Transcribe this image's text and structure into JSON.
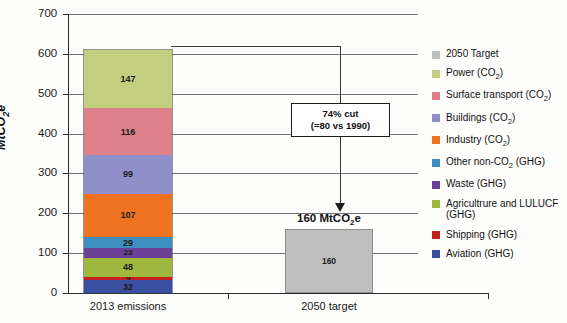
{
  "chart_data": {
    "type": "bar",
    "subtype": "stacked-bar",
    "title": "",
    "xlabel": "",
    "ylabel": "MtCO2e",
    "ylabel_display": "MtCO₂e",
    "ylim": [
      0,
      700
    ],
    "ytick_step": 100,
    "yticks": [
      700,
      600,
      500,
      400,
      300,
      200,
      100,
      0
    ],
    "ytick_labels": [
      "700",
      "600",
      "500",
      "400",
      "300",
      "200",
      "100",
      "0"
    ],
    "grid": true,
    "grid_axis": "y",
    "legend_position": "right",
    "categories": [
      "2013 emissions",
      "2050 target"
    ],
    "series": [
      {
        "name": "Power (CO2)",
        "label": "Power (CO₂)",
        "color": "#c3cf7e",
        "values": [
          147,
          0
        ],
        "stack_order": 9
      },
      {
        "name": "Surface transport (CO2)",
        "label": "Surface transport (CO₂)",
        "color": "#dd8089",
        "values": [
          116,
          0
        ],
        "stack_order": 8
      },
      {
        "name": "Buildings (CO2)",
        "label": "Buildings (CO₂)",
        "color": "#8e8fc8",
        "values": [
          99,
          0
        ],
        "stack_order": 7
      },
      {
        "name": "Industry (CO2)",
        "label": "Industry (CO₂)",
        "color": "#ee7220",
        "values": [
          107,
          0
        ],
        "stack_order": 6
      },
      {
        "name": "Other non-CO2 (GHG)",
        "label": "Other non-CO₂ (GHG)",
        "color": "#3d8fc0",
        "values": [
          29,
          0
        ],
        "stack_order": 5
      },
      {
        "name": "Waste (GHG)",
        "label": "Waste (GHG)",
        "color": "#6b3f96",
        "values": [
          23,
          0
        ],
        "stack_order": 4
      },
      {
        "name": "Agricultrure and LULUCF (GHG)",
        "label": "Agricultrure and LULUCF (GHG)",
        "color": "#9eb83f",
        "values": [
          48,
          0
        ],
        "stack_order": 3
      },
      {
        "name": "Shipping (GHG)",
        "label": "Shipping (GHG)",
        "color": "#c4201f",
        "values": [
          9,
          0
        ],
        "stack_order": 2
      },
      {
        "name": "Aviation (GHG)",
        "label": "Aviation (GHG)",
        "color": "#3b4fa0",
        "values": [
          32,
          0
        ],
        "stack_order": 1
      },
      {
        "name": "2050 Target",
        "label": "2050 Target",
        "color": "#bfbfbf",
        "values": [
          0,
          160
        ],
        "stack_order": 0
      }
    ],
    "totals": [
      610,
      160
    ],
    "annotations": [
      {
        "text_line1": "74% cut",
        "text_line2": "(=80 vs 1990)",
        "type": "callout-box-with-arrow"
      },
      {
        "text": "160 MtCO₂e",
        "type": "bar-value-label",
        "attached_to": "2050 target"
      }
    ]
  },
  "axis": {
    "y_label_main": "MtCO",
    "y_label_sub": "2",
    "y_label_tail": "e",
    "ticks": [
      {
        "value": "700"
      },
      {
        "value": "600"
      },
      {
        "value": "500"
      },
      {
        "value": "400"
      },
      {
        "value": "300"
      },
      {
        "value": "200"
      },
      {
        "value": "100"
      },
      {
        "value": "0"
      }
    ]
  },
  "categories": [
    {
      "label": "2013 emissions"
    },
    {
      "label": "2050 target"
    }
  ],
  "stack_segments": [
    {
      "value": "147",
      "color": "#c3cf7e",
      "name": "power"
    },
    {
      "value": "116",
      "color": "#dd8089",
      "name": "surface-transport"
    },
    {
      "value": "99",
      "color": "#8e8fc8",
      "name": "buildings"
    },
    {
      "value": "107",
      "color": "#ee7220",
      "name": "industry"
    },
    {
      "value": "29",
      "color": "#3d8fc0",
      "name": "other-non-co2"
    },
    {
      "value": "23",
      "color": "#6b3f96",
      "name": "waste"
    },
    {
      "value": "48",
      "color": "#9eb83f",
      "name": "agriculture-lulucf"
    },
    {
      "value": "9",
      "color": "#c4201f",
      "name": "shipping"
    },
    {
      "value": "32",
      "color": "#3b4fa0",
      "name": "aviation"
    }
  ],
  "target_bar": {
    "value": "160",
    "caption_main": "160 MtCO",
    "caption_sub": "2",
    "caption_tail": "e",
    "color": "#bfbfbf"
  },
  "callout": {
    "line1": "74% cut",
    "line2": "(=80 vs 1990)"
  },
  "legend": {
    "items": [
      {
        "label": "2050 Target",
        "color": "#bfbfbf",
        "has_sub": false,
        "name": "2050-target"
      },
      {
        "label": "Power (CO",
        "sub": "2",
        "tail": ")",
        "color": "#c3cf7e",
        "has_sub": true,
        "name": "power"
      },
      {
        "label": "Surface transport (CO",
        "sub": "2",
        "tail": ")",
        "color": "#dd8089",
        "has_sub": true,
        "name": "surface-transport"
      },
      {
        "label": "Buildings (CO",
        "sub": "2",
        "tail": ")",
        "color": "#8e8fc8",
        "has_sub": true,
        "name": "buildings"
      },
      {
        "label": "Industry (CO",
        "sub": "2",
        "tail": ")",
        "color": "#ee7220",
        "has_sub": true,
        "name": "industry"
      },
      {
        "label": "Other non-CO",
        "sub": "2",
        "tail": " (GHG)",
        "color": "#3d8fc0",
        "has_sub": true,
        "name": "other-non-co2"
      },
      {
        "label": "Waste (GHG)",
        "color": "#6b3f96",
        "has_sub": false,
        "name": "waste"
      },
      {
        "label": "Agricultrure and LULUCF (GHG)",
        "color": "#9eb83f",
        "has_sub": false,
        "name": "agriculture-lulucf"
      },
      {
        "label": "Shipping (GHG)",
        "color": "#c4201f",
        "has_sub": false,
        "name": "shipping"
      },
      {
        "label": "Aviation (GHG)",
        "color": "#3b4fa0",
        "has_sub": false,
        "name": "aviation"
      }
    ]
  }
}
